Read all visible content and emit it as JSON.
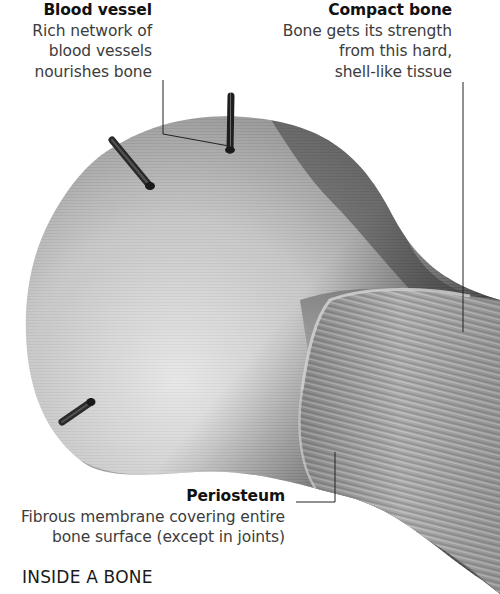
{
  "figure": {
    "heading": "INSIDE A BONE",
    "labels": [
      {
        "id": "blood-vessel",
        "title": "Blood vessel",
        "description_lines": [
          "Rich network of",
          "blood vessels",
          "nourishes bone"
        ]
      },
      {
        "id": "compact-bone",
        "title": "Compact bone",
        "description_lines": [
          "Bone gets its strength",
          "from this hard,",
          "shell-like tissue"
        ]
      },
      {
        "id": "periosteum",
        "title": "Periosteum",
        "description_lines": [
          "Fibrous membrane covering entire",
          "bone surface (except in joints)"
        ]
      }
    ],
    "colors": {
      "background": "#ffffff",
      "bone_light": "#d9d9d9",
      "bone_mid": "#a8a8a8",
      "bone_dark": "#3e3e3e",
      "leader_line": "#222222",
      "title_text": "#111111",
      "body_text": "#3c3c3c"
    }
  }
}
